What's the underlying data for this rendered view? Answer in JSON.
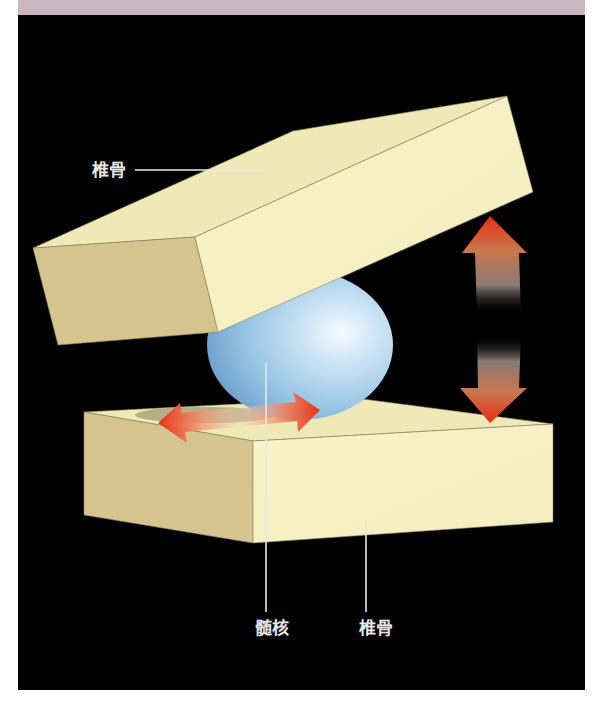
{
  "header_band": {
    "color": "#c9b6c0"
  },
  "diagram": {
    "background": "#000000",
    "labels": {
      "upper_vertebra": "椎骨",
      "nucleus_pulposus": "髄核",
      "lower_vertebra": "椎骨"
    },
    "colors": {
      "block_top": "#efe9b8",
      "block_front": "#f7f2c6",
      "block_side": "#d6c48e",
      "sphere": "#8fbfe0",
      "sphere_highlight": "#f4faff",
      "arrow_red": "#e8331a",
      "leader_line": "#e8e8e8"
    },
    "arrows": [
      {
        "name": "vertical-double-arrow",
        "meaning": "compression-extension"
      },
      {
        "name": "horizontal-double-arrow",
        "meaning": "lateral-shift"
      }
    ]
  }
}
